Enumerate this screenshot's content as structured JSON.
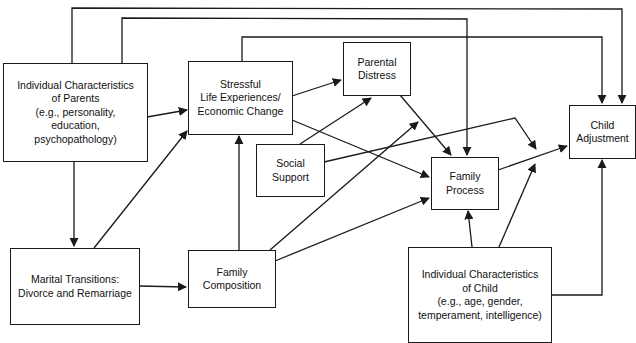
{
  "diagram": {
    "nodes": [
      {
        "id": "parents",
        "lines": [
          "Individual Characteristics",
          "of Parents",
          "(e.g., personality,",
          "education,",
          "psychopathology)"
        ]
      },
      {
        "id": "stress",
        "lines": [
          "Stressful",
          "Life Experiences/",
          "Economic Change"
        ]
      },
      {
        "id": "distress",
        "lines": [
          "Parental",
          "Distress"
        ]
      },
      {
        "id": "support",
        "lines": [
          "Social",
          "Support"
        ]
      },
      {
        "id": "process",
        "lines": [
          "Family",
          "Process"
        ]
      },
      {
        "id": "adjustment",
        "lines": [
          "Child",
          "Adjustment"
        ]
      },
      {
        "id": "marital",
        "lines": [
          "Marital Transitions:",
          "Divorce and Remarriage"
        ]
      },
      {
        "id": "composition",
        "lines": [
          "Family",
          "Composition"
        ]
      },
      {
        "id": "child",
        "lines": [
          "Individual Characteristics",
          "of Child",
          "(e.g., age, gender,",
          "temperament, intelligence)"
        ]
      }
    ],
    "edges": [
      {
        "from": "parents",
        "to": "adjustment"
      },
      {
        "from": "parents",
        "to": "process"
      },
      {
        "from": "parents",
        "to": "stress"
      },
      {
        "from": "parents",
        "to": "marital"
      },
      {
        "from": "stress",
        "to": "adjustment"
      },
      {
        "from": "stress",
        "to": "distress"
      },
      {
        "from": "stress",
        "to": "process"
      },
      {
        "from": "distress",
        "to": "process"
      },
      {
        "from": "support",
        "to": "distress"
      },
      {
        "from": "support",
        "to": "process-adjustment-path"
      },
      {
        "from": "marital",
        "to": "stress"
      },
      {
        "from": "marital",
        "to": "composition"
      },
      {
        "from": "composition",
        "to": "stress"
      },
      {
        "from": "composition",
        "to": "distress"
      },
      {
        "from": "composition",
        "to": "process"
      },
      {
        "from": "process",
        "to": "adjustment"
      },
      {
        "from": "child",
        "to": "process"
      },
      {
        "from": "child",
        "to": "process-adjustment-path"
      },
      {
        "from": "child",
        "to": "adjustment"
      }
    ]
  }
}
